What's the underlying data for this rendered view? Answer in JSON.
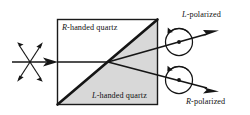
{
  "figure": {
    "width": 250,
    "height": 115,
    "background_color": "#ffffff",
    "stroke_color": "#111111",
    "shaded_region_color": "#d8d8d8"
  },
  "crystal": {
    "top_region_label_prefix": "R",
    "top_region_label_suffix": "-handed quartz",
    "bottom_region_label_prefix": "L",
    "bottom_region_label_suffix": "-handed quartz",
    "top_region_fill": "#ffffff",
    "bottom_region_fill": "#d8d8d8",
    "box": {
      "x": 57,
      "y": 19,
      "width": 101,
      "height": 86
    }
  },
  "input_beam": {
    "name": "unpolarized-light",
    "description": "horizontal ray with crossed double-headed arrows"
  },
  "output_beams": [
    {
      "label_prefix": "L",
      "label_suffix": "-polarized",
      "handedness": "left",
      "direction": "up-right",
      "rotation_sense": "counterclockwise"
    },
    {
      "label_prefix": "R",
      "label_suffix": "-polarized",
      "handedness": "right",
      "direction": "down-right",
      "rotation_sense": "counterclockwise"
    }
  ]
}
